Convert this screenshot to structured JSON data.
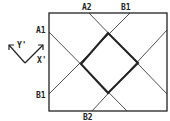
{
  "diagram": {
    "labels": {
      "a2_top": "A2",
      "b1_top": "B1",
      "a1_left": "A1",
      "b1_left": "B1",
      "b2_bottom": "B2",
      "axis_y": "Y'",
      "axis_x": "X'"
    },
    "colors": {
      "line": "#222222",
      "background": "#ffffff"
    },
    "rectangle": {
      "x": 49,
      "y": 13,
      "width": 118,
      "height": 98
    },
    "diamond": {
      "top": [
        108,
        33
      ],
      "left": [
        81,
        64
      ],
      "bottom": [
        108,
        93
      ],
      "right": [
        138,
        63
      ]
    }
  }
}
